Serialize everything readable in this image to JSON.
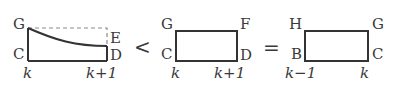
{
  "colors": {
    "line": "#333333",
    "dashed": "#8a8a8a",
    "text": "#3a3a3a",
    "background": "#ffffff"
  },
  "figure1": {
    "points": {
      "G": "G",
      "E": "E",
      "C": "C",
      "D": "D"
    },
    "axis_labels": {
      "left": "k",
      "right": "k+1"
    },
    "description": "Region under decreasing curve from G to E over [k, k+1], with dashed rectangle top from G extending to above E"
  },
  "operator1": "<",
  "figure2": {
    "points": {
      "G": "G",
      "F": "F",
      "C": "C",
      "D": "D"
    },
    "axis_labels": {
      "left": "k",
      "right": "k+1"
    },
    "description": "Rectangle GFDC over [k, k+1]"
  },
  "operator2": "=",
  "figure3": {
    "points": {
      "H": "H",
      "G": "G",
      "B": "B",
      "C": "C"
    },
    "axis_labels": {
      "left": "k−1",
      "right": "k"
    },
    "description": "Rectangle HGCB over [k−1, k]"
  }
}
